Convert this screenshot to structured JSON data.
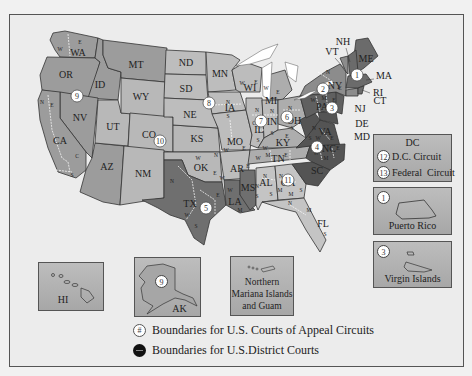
{
  "map": {
    "title": "U.S. Federal Courts Circuit and District Boundaries",
    "colors": {
      "background": "#ececec",
      "shade_light": "#bcbcbc",
      "shade_mid": "#9e9e9e",
      "shade_dark": "#6e6e6e",
      "shade_darkest": "#555555",
      "district_line": "#ffffff",
      "state_line": "#333333"
    },
    "states": [
      {
        "abbr": "WA",
        "districts": [
          "W",
          "E"
        ],
        "circuit": 9
      },
      {
        "abbr": "OR",
        "districts": [],
        "circuit": 9
      },
      {
        "abbr": "ID",
        "districts": [],
        "circuit": 9
      },
      {
        "abbr": "MT",
        "districts": [],
        "circuit": 9
      },
      {
        "abbr": "NV",
        "districts": [],
        "circuit": 9
      },
      {
        "abbr": "CA",
        "districts": [
          "N",
          "E",
          "C",
          "S"
        ],
        "circuit": 9
      },
      {
        "abbr": "AZ",
        "districts": [],
        "circuit": 9
      },
      {
        "abbr": "UT",
        "districts": [],
        "circuit": 10
      },
      {
        "abbr": "WY",
        "districts": [],
        "circuit": 10
      },
      {
        "abbr": "CO",
        "districts": [],
        "circuit": 10
      },
      {
        "abbr": "NM",
        "districts": [],
        "circuit": 10
      },
      {
        "abbr": "KS",
        "districts": [],
        "circuit": 10
      },
      {
        "abbr": "OK",
        "districts": [
          "N",
          "W",
          "E"
        ],
        "circuit": 10
      },
      {
        "abbr": "ND",
        "districts": [],
        "circuit": 8
      },
      {
        "abbr": "SD",
        "districts": [],
        "circuit": 8
      },
      {
        "abbr": "NE",
        "districts": [],
        "circuit": 8
      },
      {
        "abbr": "MN",
        "districts": [],
        "circuit": 8
      },
      {
        "abbr": "IA",
        "districts": [
          "N",
          "S"
        ],
        "circuit": 8
      },
      {
        "abbr": "MO",
        "districts": [
          "W",
          "E"
        ],
        "circuit": 8
      },
      {
        "abbr": "AR",
        "districts": [
          "W",
          "E"
        ],
        "circuit": 8
      },
      {
        "abbr": "TX",
        "districts": [
          "N",
          "W",
          "E",
          "S"
        ],
        "circuit": 5
      },
      {
        "abbr": "LA",
        "districts": [
          "W",
          "M",
          "E"
        ],
        "circuit": 5
      },
      {
        "abbr": "MS",
        "districts": [
          "N",
          "S"
        ],
        "circuit": 5
      },
      {
        "abbr": "WI",
        "districts": [
          "W",
          "E"
        ],
        "circuit": 7
      },
      {
        "abbr": "IL",
        "districts": [
          "N",
          "C",
          "S"
        ],
        "circuit": 7
      },
      {
        "abbr": "IN",
        "districts": [
          "N",
          "S"
        ],
        "circuit": 7
      },
      {
        "abbr": "MI",
        "districts": [
          "W",
          "E"
        ],
        "circuit": 6
      },
      {
        "abbr": "OH",
        "districts": [
          "N",
          "S"
        ],
        "circuit": 6
      },
      {
        "abbr": "KY",
        "districts": [
          "W",
          "E"
        ],
        "circuit": 6
      },
      {
        "abbr": "TN",
        "districts": [
          "W",
          "M",
          "E"
        ],
        "circuit": 6
      },
      {
        "abbr": "AL",
        "districts": [
          "N",
          "M",
          "S"
        ],
        "circuit": 11
      },
      {
        "abbr": "GA",
        "districts": [
          "N",
          "M",
          "S"
        ],
        "circuit": 11
      },
      {
        "abbr": "FL",
        "districts": [
          "N",
          "M",
          "S"
        ],
        "circuit": 11
      },
      {
        "abbr": "SC",
        "districts": [],
        "circuit": 4
      },
      {
        "abbr": "NC",
        "districts": [
          "W",
          "M",
          "E"
        ],
        "circuit": 4
      },
      {
        "abbr": "VA",
        "districts": [
          "W",
          "E"
        ],
        "circuit": 4
      },
      {
        "abbr": "WV",
        "districts": [
          "N",
          "S"
        ],
        "circuit": 4
      },
      {
        "abbr": "MD",
        "districts": [],
        "circuit": 4
      },
      {
        "abbr": "PA",
        "districts": [
          "W",
          "M",
          "E"
        ],
        "circuit": 3
      },
      {
        "abbr": "NJ",
        "districts": [],
        "circuit": 3
      },
      {
        "abbr": "DE",
        "districts": [],
        "circuit": 3
      },
      {
        "abbr": "NY",
        "districts": [
          "N",
          "W",
          "E",
          "S"
        ],
        "circuit": 2
      },
      {
        "abbr": "VT",
        "districts": [],
        "circuit": 2
      },
      {
        "abbr": "CT",
        "districts": [],
        "circuit": 2
      },
      {
        "abbr": "ME",
        "districts": [],
        "circuit": 1
      },
      {
        "abbr": "NH",
        "districts": [],
        "circuit": 1
      },
      {
        "abbr": "MA",
        "districts": [],
        "circuit": 1
      },
      {
        "abbr": "RI",
        "districts": [],
        "circuit": 1
      }
    ],
    "circuit_markers": [
      "1",
      "2",
      "3",
      "4",
      "5",
      "6",
      "7",
      "8",
      "9",
      "10",
      "11"
    ],
    "callout_labels": [
      "NH",
      "VT",
      "MA",
      "RI",
      "CT",
      "NJ",
      "DE",
      "MD"
    ]
  },
  "insets": {
    "dc": {
      "title": "DC",
      "rows": [
        {
          "num": "12",
          "label": "D.C. Circuit"
        },
        {
          "num": "13",
          "label": "Federal  Circuit"
        }
      ]
    },
    "puerto_rico": {
      "num": "1",
      "label": "Puerto Rico"
    },
    "virgin_islands": {
      "num": "3",
      "label": "Virgin Islands"
    },
    "hawaii": {
      "label": "HI"
    },
    "alaska": {
      "num": "9",
      "label": "AK"
    },
    "mariana": {
      "label": "Northern Mariana Islands and Guam",
      "line1": "Northern",
      "line2": "Mariana Islands",
      "line3": "and Guam"
    }
  },
  "legend": {
    "circuit": {
      "symbol": "#",
      "label": "Boundaries for U.S. Courts of Appeal Circuits"
    },
    "district": {
      "label": "Boundaries for U.S.District Courts"
    }
  }
}
